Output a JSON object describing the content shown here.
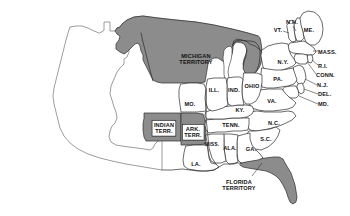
{
  "map": {
    "title": "United States circa 1830s",
    "colors": {
      "background": "#ffffff",
      "state_fill": "#ffffff",
      "territory_fill": "#8c8c8c",
      "border_stroke": "#2b2b2b",
      "unorganized_stroke": "#5a5a5a",
      "label_text": "#111111"
    },
    "legend_note": "Shaded areas denote organized territories",
    "labels": [
      {
        "id": "michigan-territory",
        "text": "MICHIGAN\nTERRITORY",
        "x": 196,
        "y": 59,
        "kind": "territory",
        "boxed": false
      },
      {
        "id": "indian-territory",
        "text": "INDIAN\nTERR.",
        "x": 164,
        "y": 128,
        "kind": "territory",
        "boxed": true
      },
      {
        "id": "arkansas-territory",
        "text": "ARK.\nTERR.",
        "x": 193,
        "y": 132,
        "kind": "territory",
        "boxed": true
      },
      {
        "id": "florida-territory",
        "text": "FLORIDA\nTERRITORY",
        "x": 239,
        "y": 185,
        "kind": "territory",
        "boxed": false
      },
      {
        "id": "maine",
        "text": "ME.",
        "x": 309,
        "y": 30,
        "kind": "state",
        "boxed": false
      },
      {
        "id": "new-hampshire",
        "text": "N.H.",
        "x": 292,
        "y": 22,
        "kind": "state",
        "boxed": false
      },
      {
        "id": "vermont",
        "text": "VT.",
        "x": 278,
        "y": 30,
        "kind": "state",
        "boxed": false
      },
      {
        "id": "massachusetts",
        "text": "MASS.",
        "x": 325,
        "y": 52,
        "kind": "state",
        "boxed": false
      },
      {
        "id": "rhode-island",
        "text": "R.I.",
        "x": 322,
        "y": 66,
        "kind": "state",
        "boxed": false
      },
      {
        "id": "connecticut",
        "text": "CONN.",
        "x": 326,
        "y": 75,
        "kind": "state",
        "boxed": false
      },
      {
        "id": "new-york",
        "text": "N.Y.",
        "x": 283,
        "y": 62,
        "kind": "state",
        "boxed": false
      },
      {
        "id": "new-jersey",
        "text": "N.J.",
        "x": 322,
        "y": 85,
        "kind": "state",
        "boxed": false
      },
      {
        "id": "pennsylvania",
        "text": "PA.",
        "x": 278,
        "y": 79,
        "kind": "state",
        "boxed": false
      },
      {
        "id": "delaware",
        "text": "DEL.",
        "x": 324,
        "y": 94,
        "kind": "state",
        "boxed": false
      },
      {
        "id": "maryland",
        "text": "MD.",
        "x": 324,
        "y": 104,
        "kind": "state",
        "boxed": false
      },
      {
        "id": "virginia",
        "text": "VA.",
        "x": 272,
        "y": 101,
        "kind": "state",
        "boxed": false
      },
      {
        "id": "north-carolina",
        "text": "N.C.",
        "x": 274,
        "y": 123,
        "kind": "state",
        "boxed": false
      },
      {
        "id": "south-carolina",
        "text": "S.C.",
        "x": 266,
        "y": 139,
        "kind": "state",
        "boxed": false
      },
      {
        "id": "georgia",
        "text": "GA.",
        "x": 251,
        "y": 149,
        "kind": "state",
        "boxed": false
      },
      {
        "id": "alabama",
        "text": "ALA.",
        "x": 230,
        "y": 148,
        "kind": "state",
        "boxed": false
      },
      {
        "id": "mississippi",
        "text": "MISS.",
        "x": 212,
        "y": 145,
        "kind": "state",
        "boxed": false
      },
      {
        "id": "louisiana",
        "text": "LA.",
        "x": 196,
        "y": 164,
        "kind": "state",
        "boxed": false
      },
      {
        "id": "tennessee",
        "text": "TENN.",
        "x": 231,
        "y": 125,
        "kind": "state",
        "boxed": false
      },
      {
        "id": "kentucky",
        "text": "KY.",
        "x": 240,
        "y": 110,
        "kind": "state",
        "boxed": false
      },
      {
        "id": "ohio",
        "text": "OHIO",
        "x": 252,
        "y": 86,
        "kind": "state",
        "boxed": false
      },
      {
        "id": "indiana",
        "text": "IND.",
        "x": 234,
        "y": 90,
        "kind": "state",
        "boxed": false
      },
      {
        "id": "illinois",
        "text": "ILL.",
        "x": 214,
        "y": 90,
        "kind": "state",
        "boxed": false
      },
      {
        "id": "missouri",
        "text": "MO.",
        "x": 190,
        "y": 104,
        "kind": "state",
        "boxed": false
      }
    ]
  }
}
